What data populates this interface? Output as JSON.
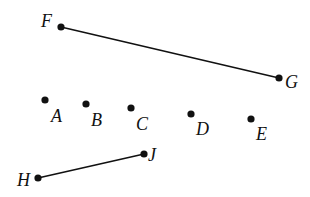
{
  "colors": {
    "ink": "#111111",
    "background": "#ffffff"
  },
  "points": [
    {
      "id": "F",
      "label": "F",
      "x": 61,
      "y": 27,
      "lx": 41,
      "ly": 27
    },
    {
      "id": "G",
      "label": "G",
      "x": 279,
      "y": 78,
      "lx": 285,
      "ly": 88
    },
    {
      "id": "A",
      "label": "A",
      "x": 45,
      "y": 100,
      "lx": 51,
      "ly": 122
    },
    {
      "id": "B",
      "label": "B",
      "x": 86,
      "y": 104,
      "lx": 91,
      "ly": 126
    },
    {
      "id": "C",
      "label": "C",
      "x": 131,
      "y": 108,
      "lx": 136,
      "ly": 130
    },
    {
      "id": "D",
      "label": "D",
      "x": 191,
      "y": 114,
      "lx": 196,
      "ly": 135
    },
    {
      "id": "E",
      "label": "E",
      "x": 251,
      "y": 119,
      "lx": 256,
      "ly": 140
    },
    {
      "id": "J",
      "label": "J",
      "x": 144,
      "y": 154,
      "lx": 148,
      "ly": 161
    },
    {
      "id": "H",
      "label": "H",
      "x": 38,
      "y": 178,
      "lx": 17,
      "ly": 186
    }
  ],
  "segments": [
    {
      "id": "FG",
      "from": "F",
      "to": "G"
    },
    {
      "id": "HJ",
      "from": "H",
      "to": "J"
    }
  ]
}
